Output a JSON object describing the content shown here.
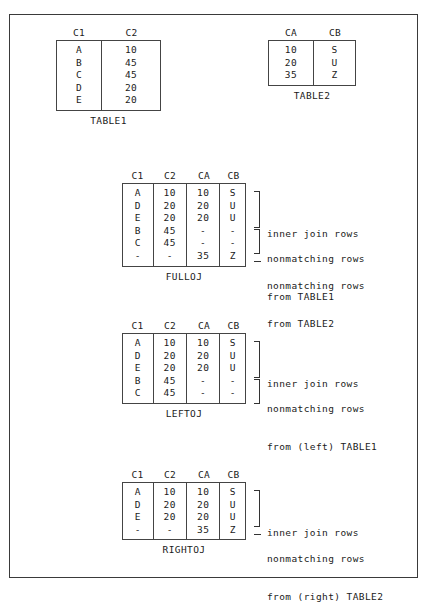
{
  "figure": {
    "border_color": "#3a3a3a",
    "background": "#ffffff"
  },
  "source_tables": [
    {
      "name": "table1",
      "caption": "TABLE1",
      "headers": [
        "C1",
        "C2"
      ],
      "rows": [
        [
          "A",
          "10"
        ],
        [
          "B",
          "45"
        ],
        [
          "C",
          "45"
        ],
        [
          "D",
          "20"
        ],
        [
          "E",
          "20"
        ]
      ]
    },
    {
      "name": "table2",
      "caption": "TABLE2",
      "headers": [
        "CA",
        "CB"
      ],
      "rows": [
        [
          "10",
          "S"
        ],
        [
          "20",
          "U"
        ],
        [
          "35",
          "Z"
        ]
      ]
    }
  ],
  "join_tables": [
    {
      "name": "fulloj",
      "caption": "FULLOJ",
      "headers": [
        "C1",
        "C2",
        "CA",
        "CB"
      ],
      "rows": [
        [
          "A",
          "10",
          "10",
          "S"
        ],
        [
          "D",
          "20",
          "20",
          "U"
        ],
        [
          "E",
          "20",
          "20",
          "U"
        ],
        [
          "B",
          "45",
          "-",
          "-"
        ],
        [
          "C",
          "45",
          "-",
          "-"
        ],
        [
          "-",
          "-",
          "35",
          "Z"
        ]
      ],
      "annotations": [
        {
          "marker": "bracket",
          "span_rows": 3,
          "start_row": 0,
          "lines": [
            "inner join rows"
          ]
        },
        {
          "marker": "bracket",
          "span_rows": 2,
          "start_row": 3,
          "lines": [
            "nonmatching rows",
            "from TABLE1"
          ]
        },
        {
          "marker": "dash",
          "span_rows": 1,
          "start_row": 5,
          "lines": [
            "nonmatching rows",
            "from TABLE2"
          ]
        }
      ]
    },
    {
      "name": "leftoj",
      "caption": "LEFTOJ",
      "headers": [
        "C1",
        "C2",
        "CA",
        "CB"
      ],
      "rows": [
        [
          "A",
          "10",
          "10",
          "S"
        ],
        [
          "D",
          "20",
          "20",
          "U"
        ],
        [
          "E",
          "20",
          "20",
          "U"
        ],
        [
          "B",
          "45",
          "-",
          "-"
        ],
        [
          "C",
          "45",
          "-",
          "-"
        ]
      ],
      "annotations": [
        {
          "marker": "bracket",
          "span_rows": 3,
          "start_row": 0,
          "lines": [
            "inner join rows"
          ]
        },
        {
          "marker": "bracket",
          "span_rows": 2,
          "start_row": 3,
          "lines": [
            "nonmatching rows",
            "from (left) TABLE1"
          ]
        }
      ]
    },
    {
      "name": "rightoj",
      "caption": "RIGHTOJ",
      "headers": [
        "C1",
        "C2",
        "CA",
        "CB"
      ],
      "rows": [
        [
          "A",
          "10",
          "10",
          "S"
        ],
        [
          "D",
          "20",
          "20",
          "U"
        ],
        [
          "E",
          "20",
          "20",
          "U"
        ],
        [
          "-",
          "-",
          "35",
          "Z"
        ]
      ],
      "annotations": [
        {
          "marker": "bracket",
          "span_rows": 3,
          "start_row": 0,
          "lines": [
            "inner join rows"
          ]
        },
        {
          "marker": "dash",
          "span_rows": 1,
          "start_row": 3,
          "lines": [
            "nonmatching rows",
            "from (right) TABLE2"
          ]
        }
      ]
    }
  ]
}
